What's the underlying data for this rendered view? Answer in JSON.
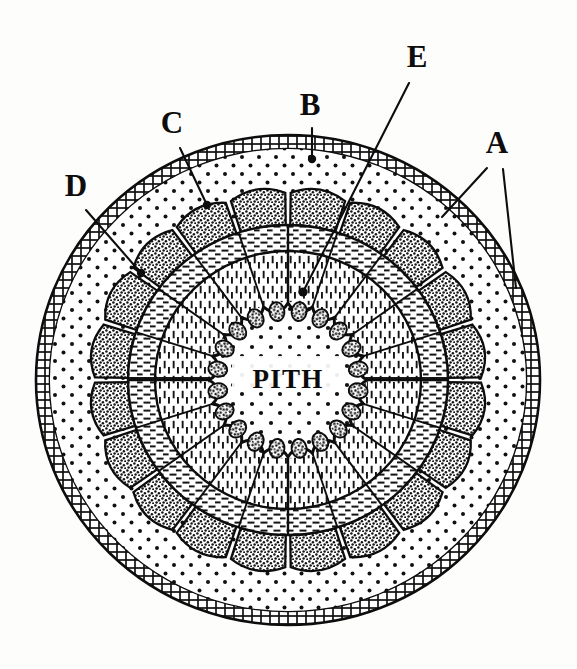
{
  "figure": {
    "kind": "botanical-cross-section",
    "background_color": "#fdfdfb",
    "ink_color": "#0d0d0d",
    "center_label": "PITH"
  },
  "labels": [
    {
      "id": "A",
      "text": "A",
      "x": 497,
      "y": 153,
      "points_to": "epidermis-outer-ring",
      "leader_count": 2
    },
    {
      "id": "B",
      "text": "B",
      "x": 310,
      "y": 115,
      "points_to": "cortex",
      "leader_count": 1
    },
    {
      "id": "C",
      "text": "C",
      "x": 172,
      "y": 133,
      "points_to": "bundle-cap",
      "leader_count": 1
    },
    {
      "id": "D",
      "text": "D",
      "x": 76,
      "y": 196,
      "points_to": "phloem",
      "leader_count": 1
    },
    {
      "id": "E",
      "text": "E",
      "x": 417,
      "y": 67,
      "points_to": "protoxylem-lacuna",
      "leader_count": 1
    }
  ],
  "leaders": [
    {
      "for": "A",
      "x1": 487,
      "y1": 168,
      "x2": 442,
      "y2": 217
    },
    {
      "for": "A",
      "x1": 503,
      "y1": 169,
      "x2": 516,
      "y2": 288
    },
    {
      "for": "B",
      "x1": 312,
      "y1": 128,
      "x2": 312,
      "y2": 159
    },
    {
      "for": "C",
      "x1": 180,
      "y1": 148,
      "x2": 207,
      "y2": 205
    },
    {
      "for": "D",
      "x1": 86,
      "y1": 210,
      "x2": 141,
      "y2": 273
    },
    {
      "for": "E",
      "x1": 409,
      "y1": 83,
      "x2": 303,
      "y2": 292
    }
  ],
  "leader_dots": [
    {
      "for": "B",
      "x": 312,
      "y": 159,
      "r": 4.2
    },
    {
      "for": "C",
      "x": 207,
      "y": 205,
      "r": 4.2
    },
    {
      "for": "D",
      "x": 141,
      "y": 273,
      "r": 4.2
    },
    {
      "for": "E",
      "x": 303,
      "y": 292,
      "r": 4.6
    }
  ],
  "structure": {
    "center": {
      "cx": 288,
      "cy": 380
    },
    "rings": [
      {
        "name": "epidermis",
        "label_key": "A",
        "outer_rx": 252,
        "outer_ry": 245,
        "inner_rx": 238,
        "inner_ry": 231,
        "pattern": "brick-cells",
        "note": "double-line band of small rectangular cells"
      },
      {
        "name": "cortex",
        "label_key": "B",
        "outer_rx": 238,
        "outer_ry": 231,
        "inner_rx": 196,
        "inner_ry": 190,
        "pattern": "sparse-dots",
        "note": "pale parenchyma with scattered dots"
      },
      {
        "name": "bundle-caps",
        "label_key": "C",
        "outer_rx": 196,
        "outer_ry": 190,
        "inner_rx": 160,
        "inner_ry": 155,
        "pattern": "dense-stipple",
        "note": "scalloped fibre caps, 20 lobes"
      },
      {
        "name": "phloem",
        "label_key": "D",
        "outer_rx": 160,
        "outer_ry": 155,
        "inner_rx": 133,
        "inner_ry": 129,
        "pattern": "horizontal-dashes",
        "note": "tangential dash hatching"
      },
      {
        "name": "xylem",
        "label_key": null,
        "outer_rx": 133,
        "outer_ry": 129,
        "inner_rx": 79,
        "inner_ry": 77,
        "pattern": "radial-dashes",
        "note": "radially aligned dashes, wedge divided"
      },
      {
        "name": "pith",
        "label_key": "E",
        "outer_rx": 79,
        "outer_ry": 77,
        "inner_rx": 0,
        "inner_ry": 0,
        "pattern": "sparse-dots",
        "note": "central dotted parenchyma"
      }
    ],
    "bundle_count": 20,
    "protoxylem_lacunae": 20
  }
}
